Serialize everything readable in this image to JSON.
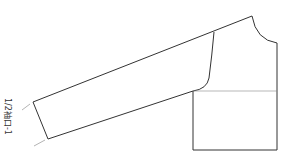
{
  "diagram": {
    "type": "garment-pattern",
    "label": "1/2袖口-1",
    "stroke_color": "#333333",
    "guide_color": "#888888"
  }
}
